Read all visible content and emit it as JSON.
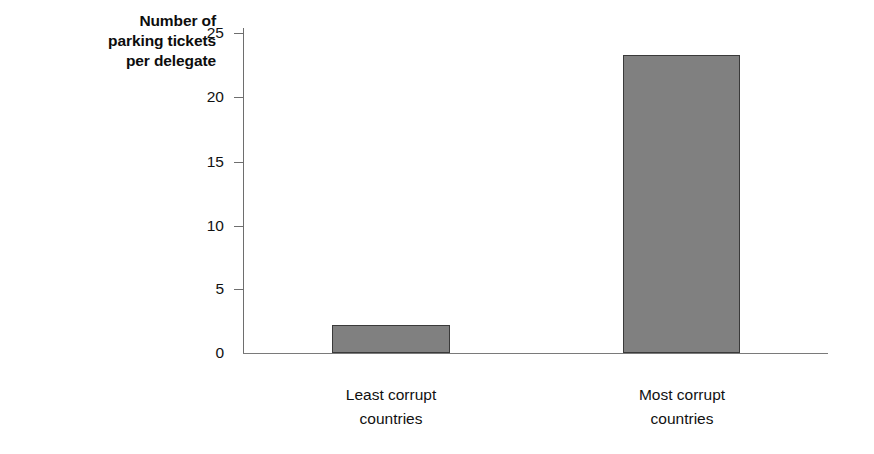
{
  "chart_data": {
    "type": "bar",
    "title": "",
    "subtitle": "",
    "categories": [
      "Least corrupt countries",
      "Most corrupt countries"
    ],
    "values": [
      2.2,
      23.3
    ],
    "xlabel": "",
    "ylabel": "Number of parking tickets per delegate",
    "ylim": [
      0,
      25
    ],
    "yticks": [
      0,
      5,
      10,
      15,
      20,
      25
    ],
    "grid": false,
    "legend": false,
    "legend_position": "none",
    "bar_color": "#808080",
    "bar_edge_color": "#3a3a3a",
    "axis_color": "#6e6e6e",
    "background": "#ffffff"
  },
  "axis": {
    "y_title_lines": [
      "Number of",
      "parking tickets",
      "per delegate"
    ],
    "y_tick_labels": [
      "25",
      "20",
      "15",
      "10",
      "5",
      "0"
    ],
    "x_category_lines": [
      [
        "Least corrupt",
        "countries"
      ],
      [
        "Most corrupt",
        "countries"
      ]
    ]
  }
}
